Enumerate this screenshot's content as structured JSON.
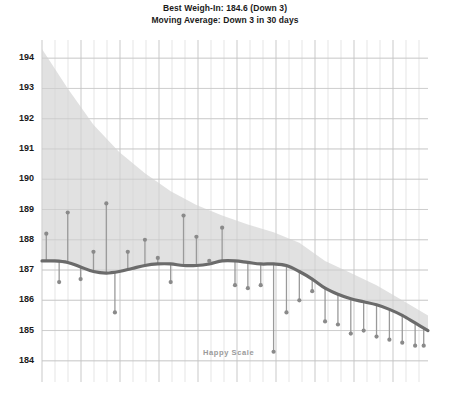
{
  "header": {
    "line1": "Best Weigh-In: 184.6 (Down 3)",
    "line2": "Moving Average: Down 3 in 30 days"
  },
  "watermark": {
    "text": "Happy Scale",
    "x": 203,
    "y": 348,
    "color": "#9a9a9a"
  },
  "style": {
    "band_fill": "#dcdcdc",
    "trend_line": "#6b6b6b",
    "point_fill": "#8a8a8a",
    "stem_color": "#9a9a9a",
    "grid_minor": "#e8e8e8",
    "grid_major": "#d0d0d0",
    "text": "#1a1a1a",
    "background": "#ffffff"
  },
  "plot_geometry": {
    "left": 42,
    "right": 428,
    "top": 40,
    "bottom": 382,
    "y_min": 183.3,
    "y_max": 194.6,
    "px_per_unit": 27.2,
    "grid_minor_step_px": 13.0,
    "grid_major_every": 3
  },
  "chart_data": {
    "type": "line",
    "title": "Best Weigh-In: 184.6 (Down 3)",
    "subtitle": "Moving Average: Down 3 in 30 days",
    "xlabel": "",
    "ylabel": "",
    "ylim": [
      183.3,
      194.6
    ],
    "grid": true,
    "legend": null,
    "yticks": [
      184,
      185,
      186,
      187,
      188,
      189,
      190,
      191,
      192,
      193,
      194
    ],
    "ytick_labels": [
      "184",
      "185",
      "186",
      "187",
      "188",
      "189",
      "190",
      "191",
      "192",
      "193",
      "194"
    ],
    "series": [
      {
        "name": "Moving Average",
        "type": "line",
        "x": [
          0,
          3,
          6,
          9,
          12,
          15,
          18,
          21,
          24,
          27,
          30,
          33,
          36,
          39,
          42,
          45,
          48,
          51,
          54,
          57,
          60,
          63,
          66,
          69,
          72,
          75,
          78,
          81,
          84,
          87,
          90
        ],
        "values": [
          187.3,
          187.3,
          187.25,
          187.1,
          186.95,
          186.9,
          186.95,
          187.05,
          187.15,
          187.2,
          187.2,
          187.15,
          187.15,
          187.2,
          187.3,
          187.3,
          187.25,
          187.2,
          187.2,
          187.15,
          186.95,
          186.7,
          186.4,
          186.2,
          186.05,
          185.95,
          185.85,
          185.7,
          185.5,
          185.25,
          185.0
        ]
      },
      {
        "name": "Projection Band Upper",
        "type": "band_upper",
        "x": [
          0,
          6,
          12,
          18,
          24,
          30,
          36,
          42,
          48,
          54,
          60,
          66,
          72,
          78,
          84,
          90
        ],
        "values": [
          194.3,
          193.0,
          191.8,
          190.9,
          190.2,
          189.6,
          189.15,
          188.8,
          188.5,
          188.25,
          187.9,
          187.3,
          186.9,
          186.5,
          186.0,
          185.5
        ]
      },
      {
        "name": "Projection Band Lower",
        "type": "band_lower",
        "x": [
          0,
          6,
          12,
          18,
          24,
          30,
          36,
          42,
          48,
          54,
          60,
          66,
          72,
          78,
          84,
          90
        ],
        "values": [
          187.3,
          187.2,
          186.95,
          186.95,
          187.15,
          187.2,
          187.15,
          187.3,
          187.25,
          187.2,
          186.95,
          186.4,
          186.05,
          185.85,
          185.5,
          185.0
        ]
      }
    ],
    "points": [
      {
        "x": 1,
        "value": 188.2
      },
      {
        "x": 4,
        "value": 186.6
      },
      {
        "x": 6,
        "value": 188.9
      },
      {
        "x": 9,
        "value": 186.7
      },
      {
        "x": 12,
        "value": 187.6
      },
      {
        "x": 15,
        "value": 189.2
      },
      {
        "x": 17,
        "value": 185.6
      },
      {
        "x": 20,
        "value": 187.6
      },
      {
        "x": 24,
        "value": 188.0
      },
      {
        "x": 27,
        "value": 187.4
      },
      {
        "x": 30,
        "value": 186.6
      },
      {
        "x": 33,
        "value": 188.8
      },
      {
        "x": 36,
        "value": 188.1
      },
      {
        "x": 39,
        "value": 187.3
      },
      {
        "x": 42,
        "value": 188.4
      },
      {
        "x": 45,
        "value": 186.5
      },
      {
        "x": 48,
        "value": 186.4
      },
      {
        "x": 51,
        "value": 186.5
      },
      {
        "x": 54,
        "value": 184.3
      },
      {
        "x": 57,
        "value": 185.6
      },
      {
        "x": 60,
        "value": 186.0
      },
      {
        "x": 63,
        "value": 186.3
      },
      {
        "x": 66,
        "value": 185.3
      },
      {
        "x": 69,
        "value": 185.2
      },
      {
        "x": 72,
        "value": 184.9
      },
      {
        "x": 75,
        "value": 185.0
      },
      {
        "x": 78,
        "value": 184.8
      },
      {
        "x": 81,
        "value": 184.7
      },
      {
        "x": 84,
        "value": 184.6
      },
      {
        "x": 87,
        "value": 184.5
      },
      {
        "x": 89,
        "value": 184.5
      }
    ]
  }
}
